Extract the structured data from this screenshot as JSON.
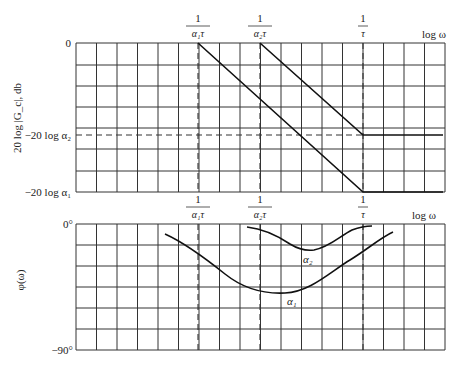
{
  "figure": {
    "type": "bode-plot-lag-network",
    "x_axis_label": "log ω",
    "break_labels": [
      {
        "num": "1",
        "den": "α₁τ",
        "x": 198
      },
      {
        "num": "1",
        "den": "α₂τ",
        "x": 260
      },
      {
        "num": "1",
        "den": "τ",
        "x": 363
      }
    ],
    "magnitude": {
      "ylabel": "20 log |Gₐ|, db",
      "ylabel_display": "20 log |G_c|, db",
      "tick_labels": {
        "zero": "0",
        "a2": "−20 log α₂",
        "a1": "−20 log α₁"
      },
      "asymptotes": [
        {
          "name": "alpha1",
          "points": [
            [
              198,
              43
            ],
            [
              363,
              192
            ],
            [
              443,
              192
            ]
          ]
        },
        {
          "name": "alpha2",
          "points": [
            [
              260,
              43
            ],
            [
              363,
              135
            ],
            [
              443,
              135
            ]
          ]
        }
      ]
    },
    "phase": {
      "ylabel": "φ(ω)",
      "tick_labels": {
        "top": "0°",
        "bottom": "−90°"
      },
      "curves": [
        {
          "name": "α₁",
          "label": "α₁"
        },
        {
          "name": "α₂",
          "label": "α₂"
        }
      ]
    }
  }
}
